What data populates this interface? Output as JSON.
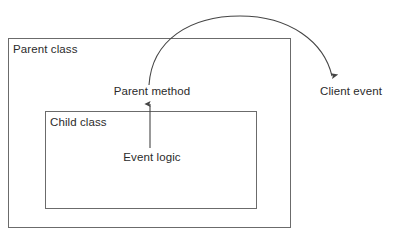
{
  "diagram": {
    "background_color": "#ffffff",
    "stroke_color": "#595959",
    "text_color": "#2b2b2b",
    "containers": [
      {
        "id": "parent-class",
        "label": "Parent class",
        "x": 8,
        "y": 38,
        "width": 283,
        "height": 190
      },
      {
        "id": "child-class",
        "label": "Child class",
        "x": 45,
        "y": 111,
        "width": 212,
        "height": 98
      }
    ],
    "nodes": [
      {
        "id": "parent-method",
        "label": "Parent method",
        "x": 152,
        "y": 91
      },
      {
        "id": "event-logic",
        "label": "Event logic",
        "x": 152,
        "y": 157
      },
      {
        "id": "client-event",
        "label": "Client event",
        "x": 356,
        "y": 91
      }
    ],
    "connectors": [
      {
        "id": "event-logic-to-parent-method",
        "from": "event-logic",
        "to": "parent-method",
        "shape": "straight-vertical",
        "direction": "up",
        "arrowhead": "end"
      },
      {
        "id": "parent-method-to-client-event",
        "from": "parent-method",
        "to": "client-event",
        "shape": "arc",
        "direction": "up-over-right",
        "arrowhead": "end"
      }
    ]
  },
  "labels": {
    "parent_class": "Parent class",
    "child_class": "Child class",
    "parent_method": "Parent method",
    "event_logic": "Event logic",
    "client_event": "Client event"
  }
}
